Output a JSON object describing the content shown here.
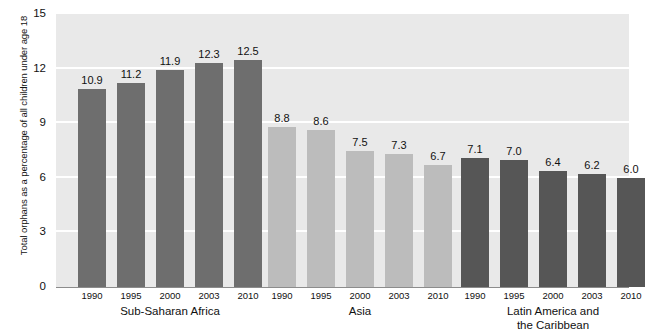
{
  "chart_data": {
    "type": "bar",
    "title": "",
    "subtitle": "",
    "xlabel": "",
    "ylabel": "Total orphans as a percentage of all children under age 18",
    "ylim": [
      0,
      15
    ],
    "y_ticks": [
      "0",
      "3",
      "6",
      "9",
      "12",
      "15"
    ],
    "y_tick_values": [
      0,
      3,
      6,
      9,
      12,
      15
    ],
    "grid": "horizontal",
    "legend_position": "none",
    "categories": [
      "1990",
      "1995",
      "2000",
      "2003",
      "2010"
    ],
    "groups": [
      {
        "name": "Sub-Saharan Africa",
        "label_lines": [
          "Sub-Saharan Africa"
        ],
        "color": "#6e6e6e",
        "categories": [
          "1990",
          "1995",
          "2000",
          "2003",
          "2010"
        ],
        "values": [
          10.9,
          11.2,
          11.9,
          12.3,
          12.5
        ],
        "value_labels": [
          "10.9",
          "11.2",
          "11.9",
          "12.3",
          "12.5"
        ]
      },
      {
        "name": "Asia",
        "label_lines": [
          "Asia"
        ],
        "color": "#bcbcbc",
        "categories": [
          "1990",
          "1995",
          "2000",
          "2003",
          "2010"
        ],
        "values": [
          8.8,
          8.6,
          7.5,
          7.3,
          6.7
        ],
        "value_labels": [
          "8.8",
          "8.6",
          "7.5",
          "7.3",
          "6.7"
        ]
      },
      {
        "name": "Latin America and the Caribbean",
        "label_lines": [
          "Latin America and",
          "the Caribbean"
        ],
        "color": "#565656",
        "categories": [
          "1990",
          "1995",
          "2000",
          "2003",
          "2010"
        ],
        "values": [
          7.1,
          7.0,
          6.4,
          6.2,
          6.0
        ],
        "value_labels": [
          "7.1",
          "7.0",
          "6.4",
          "6.2",
          "6.0"
        ]
      }
    ],
    "series": [
      {
        "name": "Sub-Saharan Africa",
        "values": [
          10.9,
          11.2,
          11.9,
          12.3,
          12.5
        ]
      },
      {
        "name": "Asia",
        "values": [
          8.8,
          8.6,
          7.5,
          7.3,
          6.7
        ]
      },
      {
        "name": "Latin America and the Caribbean",
        "values": [
          7.1,
          7.0,
          6.4,
          6.2,
          6.0
        ]
      }
    ],
    "colors": {
      "plot_background": "#e9e9e9",
      "gridline": "#ffffff",
      "axis": "#8c8c8c",
      "text": "#111111",
      "page_background": "#ffffff"
    }
  }
}
